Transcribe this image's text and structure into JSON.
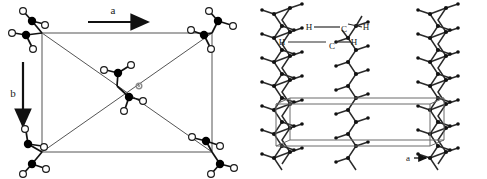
{
  "figure": {
    "background_color": "#ffffff",
    "line_color": "#3a3a3a",
    "carbon_color": "#000000",
    "hydrogen_color": "#ffffff",
    "hydrogen_stroke": "#1a1a1a",
    "center_marker_color": "#8a8a8a",
    "width": 487,
    "height": 179
  },
  "left_panel": {
    "name": "unit-cell-projection",
    "axis_a": {
      "label": "a",
      "direction": "right"
    },
    "axis_b": {
      "label": "b",
      "direction": "down"
    },
    "cell": {
      "x": 42,
      "y": 33,
      "width": 170,
      "height": 119
    },
    "diagonals": true,
    "corner_groups": 4,
    "center_groups": 2,
    "atom_types": [
      "carbon",
      "hydrogen"
    ]
  },
  "right_panel": {
    "name": "chain-side-view",
    "axis_a": {
      "label": "a"
    },
    "axis_c": {
      "label": "c"
    },
    "labels": {
      "carbon_upper": "C",
      "carbon_lower": "C",
      "hydrogen_upper_left": "H",
      "hydrogen_upper_right": "H",
      "hydrogen_lower_left": "H",
      "hydrogen_lower_right": "H"
    },
    "chains": 3,
    "chain_type": "planar-zigzag"
  }
}
